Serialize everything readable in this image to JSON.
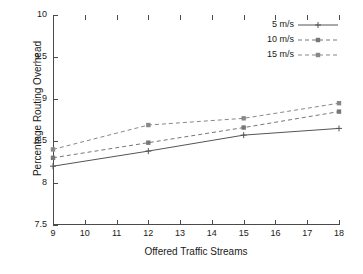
{
  "chart_data": {
    "type": "line",
    "title": "",
    "xlabel": "Offered Traffic Streams",
    "ylabel": "Percentage Routing Overhead",
    "x": [
      9,
      12,
      15,
      18
    ],
    "xlim": [
      9,
      18
    ],
    "ylim": [
      7.5,
      10
    ],
    "xticks": [
      9,
      10,
      11,
      12,
      13,
      14,
      15,
      16,
      17,
      18
    ],
    "xticklabels": [
      "9",
      "10",
      "11",
      "12",
      "13",
      "14",
      "15",
      "16",
      "17",
      "18"
    ],
    "yticks": [
      7.5,
      8,
      8.5,
      9,
      9.5,
      10
    ],
    "yticklabels": [
      "7.5",
      "8",
      "8.5",
      "9",
      "9.5",
      "10"
    ],
    "grid": false,
    "legend_position": "top-right",
    "series": [
      {
        "name": "5 m/s",
        "values": [
          8.2,
          8.38,
          8.57,
          8.65
        ],
        "style": "solid",
        "marker": "plus",
        "color": "#555555"
      },
      {
        "name": "10 m/s",
        "values": [
          8.3,
          8.48,
          8.66,
          8.85
        ],
        "style": "dashed",
        "marker": "square",
        "color": "#777777"
      },
      {
        "name": "15 m/s",
        "values": [
          8.4,
          8.69,
          8.77,
          8.95
        ],
        "style": "dashed",
        "marker": "square",
        "color": "#888888"
      }
    ]
  },
  "legend": {
    "items": [
      {
        "label": "5 m/s"
      },
      {
        "label": "10 m/s"
      },
      {
        "label": "15 m/s"
      }
    ]
  },
  "colors": {
    "axis": "#4a4a4a",
    "text": "#1a1a1a",
    "background": "#ffffff"
  }
}
